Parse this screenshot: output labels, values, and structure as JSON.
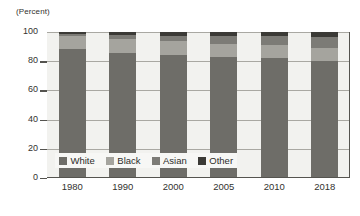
{
  "axis": {
    "unit_label": "(Percent)",
    "y_ticks": [
      "100",
      "80",
      "60",
      "40",
      "20",
      "0"
    ],
    "y_tick_values": [
      100,
      80,
      60,
      40,
      20,
      0
    ]
  },
  "legend": {
    "items": [
      {
        "label": "White",
        "color": "#6e6d68"
      },
      {
        "label": "Black",
        "color": "#a5a49e"
      },
      {
        "label": "Asian",
        "color": "#7c7b76"
      },
      {
        "label": "Other",
        "color": "#3b3a36"
      }
    ]
  },
  "chart_data": {
    "type": "bar",
    "subtype": "stacked-100",
    "title": "",
    "subtitle": "",
    "xlabel": "",
    "ylabel": "(Percent)",
    "ylim": [
      0,
      100
    ],
    "grid": true,
    "legend_position": "inside-bottom-left",
    "categories": [
      "1980",
      "1990",
      "2000",
      "2005",
      "2010",
      "2018"
    ],
    "series": [
      {
        "name": "White",
        "color": "#6e6d68",
        "values": [
          88,
          85.5,
          84,
          82.5,
          82,
          80
        ]
      },
      {
        "name": "Black",
        "color": "#a5a49e",
        "values": [
          9,
          10,
          9.5,
          9.5,
          9,
          9
        ]
      },
      {
        "name": "Asian",
        "color": "#7c7b76",
        "values": [
          1.5,
          2.5,
          4,
          5,
          6,
          7.5
        ]
      },
      {
        "name": "Other",
        "color": "#3b3a36",
        "values": [
          1.5,
          2,
          2.5,
          3,
          3,
          3.5
        ]
      }
    ]
  },
  "style": {
    "plot_background": "#f2f2ef",
    "grid_color": "#a9a8a2",
    "axis_color": "#55544f",
    "text_color": "#33322f"
  }
}
